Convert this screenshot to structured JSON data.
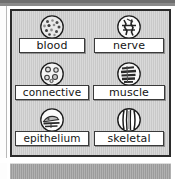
{
  "panel": {
    "title": "tissue types grid",
    "background_color": "#c9c9c9",
    "border_color": "#2b2b2b"
  },
  "cells": [
    {
      "key": "blood",
      "label": "blood",
      "icon": "blood-cells-circle-icon",
      "icon_description": "circle filled with many small dark dots representing blood cells"
    },
    {
      "key": "nerve",
      "label": "nerve",
      "icon": "neuron-branching-circle-icon",
      "icon_description": "circle containing branching neuron fibers"
    },
    {
      "key": "connective",
      "label": "connective",
      "icon": "connective-cells-circle-icon",
      "icon_description": "circle with a few large scattered open cells"
    },
    {
      "key": "muscle",
      "label": "muscle",
      "icon": "striated-muscle-circle-icon",
      "icon_description": "circle with horizontal striated muscle bands"
    },
    {
      "key": "epithelium",
      "label": "epithelium",
      "icon": "epithelium-layers-circle-icon",
      "icon_description": "circle with flat stacked epithelial cell layers"
    },
    {
      "key": "skeletal",
      "label": "skeletal",
      "icon": "skeletal-fibers-circle-icon",
      "icon_description": "circle with vertical parallel skeletal fibers"
    }
  ],
  "bottom_bar": {
    "text": "",
    "color": "#9b9b9b"
  }
}
